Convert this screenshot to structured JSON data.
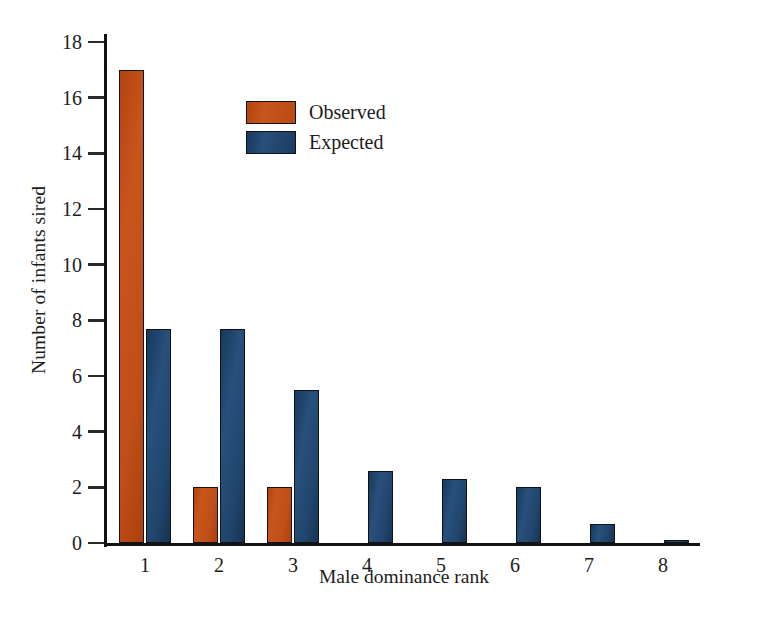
{
  "chart_data": {
    "type": "bar",
    "title": "",
    "xlabel": "Male dominance rank",
    "ylabel": "Number of infants sired",
    "categories": [
      "1",
      "2",
      "3",
      "4",
      "5",
      "6",
      "7",
      "8"
    ],
    "series": [
      {
        "name": "Observed",
        "color": "#c2501a",
        "values": [
          17,
          2,
          2,
          0,
          0,
          0,
          0,
          0
        ]
      },
      {
        "name": "Expected",
        "color": "#214a72",
        "values": [
          7.7,
          7.7,
          5.5,
          2.6,
          2.3,
          2.0,
          0.7,
          0.1
        ]
      }
    ],
    "ylim": [
      0,
      18
    ],
    "yticks": [
      0,
      2,
      4,
      6,
      8,
      10,
      12,
      14,
      16,
      18
    ],
    "ytick_labels": [
      "0",
      "2",
      "4",
      "6",
      "8",
      "10",
      "12",
      "14",
      "16",
      "18"
    ],
    "grid": false,
    "legend_position": "upper-center"
  },
  "legend": {
    "entries": [
      {
        "label": "Observed",
        "color": "#c2501a"
      },
      {
        "label": "Expected",
        "color": "#214a72"
      }
    ]
  },
  "axes": {
    "y_title": "Number of infants sired",
    "x_title": "Male dominance rank"
  }
}
